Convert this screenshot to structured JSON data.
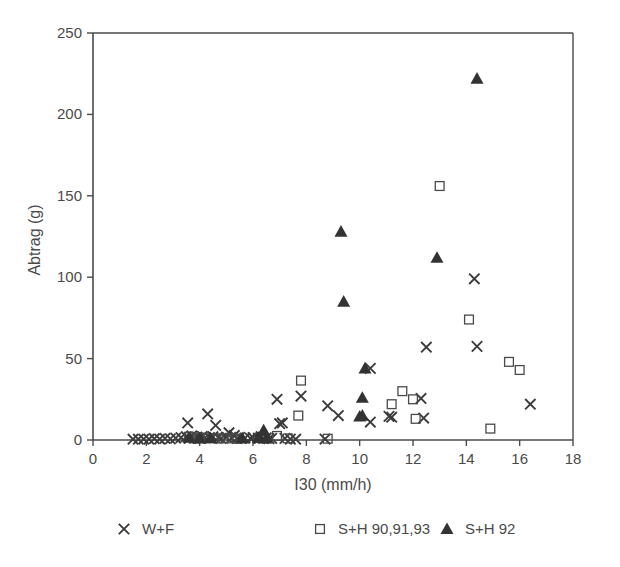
{
  "chart_data": {
    "type": "scatter",
    "title": "",
    "xlabel": "I30 (mm/h)",
    "ylabel": "Abtrag (g)",
    "xlim": [
      0,
      18
    ],
    "ylim": [
      0,
      250
    ],
    "xticks": [
      0,
      2,
      4,
      6,
      8,
      10,
      12,
      14,
      16,
      18
    ],
    "yticks": [
      0,
      50,
      100,
      150,
      200,
      250
    ],
    "grid": false,
    "legend_position": "bottom",
    "series": [
      {
        "name": "W+F",
        "marker": "x",
        "color": "#3c3c3c",
        "points": [
          [
            1.5,
            0.5
          ],
          [
            1.7,
            0.5
          ],
          [
            1.9,
            0.6
          ],
          [
            2.1,
            0.5
          ],
          [
            2.3,
            0.8
          ],
          [
            2.5,
            0.6
          ],
          [
            2.7,
            1.0
          ],
          [
            2.9,
            0.7
          ],
          [
            3.1,
            1.2
          ],
          [
            3.3,
            1.5
          ],
          [
            3.5,
            2.0
          ],
          [
            3.55,
            10.5
          ],
          [
            3.6,
            1.0
          ],
          [
            3.7,
            2.5
          ],
          [
            3.8,
            1.2
          ],
          [
            3.9,
            1.8
          ],
          [
            4.0,
            1.0
          ],
          [
            4.1,
            2.2
          ],
          [
            4.2,
            1.4
          ],
          [
            4.3,
            16.0
          ],
          [
            4.4,
            1.1
          ],
          [
            4.5,
            2.0
          ],
          [
            4.6,
            9.0
          ],
          [
            4.7,
            1.5
          ],
          [
            4.8,
            1.0
          ],
          [
            5.0,
            1.8
          ],
          [
            5.1,
            4.5
          ],
          [
            5.2,
            1.2
          ],
          [
            5.3,
            2.8
          ],
          [
            5.4,
            1.0
          ],
          [
            5.5,
            1.6
          ],
          [
            5.7,
            1.2
          ],
          [
            5.9,
            1.0
          ],
          [
            6.0,
            1.5
          ],
          [
            6.2,
            1.1
          ],
          [
            6.3,
            2.0
          ],
          [
            6.4,
            1.0
          ],
          [
            6.5,
            1.3
          ],
          [
            6.6,
            0.8
          ],
          [
            6.7,
            1.0
          ],
          [
            6.9,
            25.0
          ],
          [
            7.0,
            10.0
          ],
          [
            7.1,
            10.5
          ],
          [
            7.2,
            1.0
          ],
          [
            7.4,
            0.6
          ],
          [
            7.6,
            0.5
          ],
          [
            7.8,
            27.0
          ],
          [
            8.7,
            0.6
          ],
          [
            8.8,
            21.0
          ],
          [
            9.2,
            15.0
          ],
          [
            10.4,
            44.0
          ],
          [
            10.4,
            11.0
          ],
          [
            11.1,
            14.5
          ],
          [
            11.2,
            14.0
          ],
          [
            12.3,
            25.5
          ],
          [
            12.4,
            13.5
          ],
          [
            12.5,
            57.0
          ],
          [
            14.3,
            99.0
          ],
          [
            14.4,
            57.5
          ],
          [
            16.4,
            22.0
          ]
        ]
      },
      {
        "name": "S+H 90,91,93",
        "marker": "square",
        "color": "#4a4a4a",
        "points": [
          [
            3.6,
            2.0
          ],
          [
            3.8,
            1.0
          ],
          [
            4.0,
            1.5
          ],
          [
            4.3,
            1.0
          ],
          [
            4.5,
            1.2
          ],
          [
            4.7,
            0.9
          ],
          [
            4.9,
            1.1
          ],
          [
            5.2,
            1.0
          ],
          [
            5.4,
            0.8
          ],
          [
            6.9,
            2.5
          ],
          [
            7.3,
            1.0
          ],
          [
            7.7,
            15.0
          ],
          [
            7.8,
            36.5
          ],
          [
            8.8,
            0.8
          ],
          [
            11.2,
            22.0
          ],
          [
            11.6,
            30.0
          ],
          [
            12.0,
            25.0
          ],
          [
            12.1,
            13.0
          ],
          [
            13.0,
            156.0
          ],
          [
            14.1,
            74.0
          ],
          [
            14.9,
            7.0
          ],
          [
            15.6,
            48.0
          ],
          [
            16.0,
            43.0
          ]
        ]
      },
      {
        "name": "S+H 92",
        "marker": "triangle",
        "color": "#333333",
        "points": [
          [
            3.6,
            1.5
          ],
          [
            4.0,
            1.0
          ],
          [
            4.4,
            1.2
          ],
          [
            5.6,
            1.0
          ],
          [
            6.2,
            1.5
          ],
          [
            6.4,
            6.0
          ],
          [
            6.5,
            1.0
          ],
          [
            9.4,
            85.0
          ],
          [
            9.3,
            128.0
          ],
          [
            10.0,
            14.5
          ],
          [
            10.1,
            26.0
          ],
          [
            10.2,
            44.0
          ],
          [
            10.1,
            15.0
          ],
          [
            12.9,
            112.0
          ],
          [
            14.4,
            222.0
          ]
        ]
      }
    ]
  },
  "legend": {
    "entries": [
      {
        "marker_icon": "x-marker-icon",
        "label": "W+F"
      },
      {
        "marker_icon": "square-marker-icon",
        "label": "S+H 90,91,93"
      },
      {
        "marker_icon": "triangle-marker-icon",
        "label": "S+H 92"
      }
    ]
  }
}
